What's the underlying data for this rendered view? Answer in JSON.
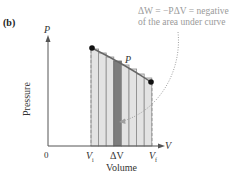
{
  "figure": {
    "panel_label": "(b)",
    "y_axis": {
      "symbol": "P",
      "label": "Pressure",
      "origin": "0"
    },
    "x_axis": {
      "symbol": "V",
      "label": "Volume"
    },
    "ticks": {
      "v_initial": "V",
      "v_initial_sub": "i",
      "delta_v": "ΔV",
      "v_final": "V",
      "v_final_sub": "f"
    },
    "curve_label": "P",
    "annotation": {
      "line1": "ΔW = −PΔV = negative",
      "line2": "of the area under curve"
    },
    "colors": {
      "axis": "#555555",
      "bar_fill": "#e3e3e3",
      "bar_stroke": "#8a8a8a",
      "highlight_bar": "#7d7d7d",
      "point": "#111111",
      "annotation_text": "#9a9a9a",
      "dotted_arrow": "#a0a0a0"
    },
    "bars": {
      "count": 8,
      "highlighted_index": 3
    }
  }
}
